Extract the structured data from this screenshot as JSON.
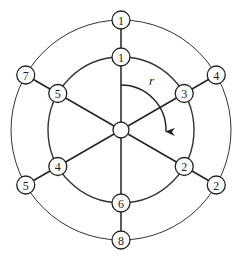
{
  "diagram": {
    "center": {
      "x": 121,
      "y": 130
    },
    "inner_radius": 73,
    "outer_radius": 110,
    "hub_radius": 8,
    "node_radius": 9,
    "rotation_label": "r",
    "spokes": [
      {
        "angle_deg": 90,
        "inner_label": "1",
        "outer_label": "1"
      },
      {
        "angle_deg": 30,
        "inner_label": "3",
        "outer_label": "4"
      },
      {
        "angle_deg": -30,
        "inner_label": "2",
        "outer_label": "2"
      },
      {
        "angle_deg": -90,
        "inner_label": "6",
        "outer_label": "8"
      },
      {
        "angle_deg": 210,
        "inner_label": "4",
        "outer_label": "5"
      },
      {
        "angle_deg": 150,
        "inner_label": "5",
        "outer_label": "7"
      }
    ]
  }
}
